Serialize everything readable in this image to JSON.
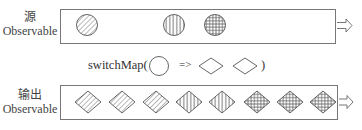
{
  "source": {
    "label_zh": "源",
    "label_en": "Observable",
    "items": [
      {
        "shape": "circle",
        "pattern": "diagonal",
        "cx": 87,
        "cy": 25
      },
      {
        "shape": "circle",
        "pattern": "vertical",
        "cx": 174,
        "cy": 25
      },
      {
        "shape": "circle",
        "pattern": "grid",
        "cx": 215,
        "cy": 25
      }
    ]
  },
  "operator": {
    "name": "switchMap(",
    "arrow": "=>",
    "close": ")",
    "shapes": [
      "circle",
      "diamond",
      "diamond"
    ]
  },
  "output": {
    "label_zh": "输出",
    "label_en": "Observable",
    "items": [
      {
        "shape": "diamond",
        "pattern": "diagonal",
        "cx": 88,
        "cy": 102
      },
      {
        "shape": "diamond",
        "pattern": "diagonal",
        "cx": 122,
        "cy": 102
      },
      {
        "shape": "diamond",
        "pattern": "diagonal",
        "cx": 156,
        "cy": 102
      },
      {
        "shape": "diamond",
        "pattern": "vertical",
        "cx": 189,
        "cy": 102
      },
      {
        "shape": "diamond",
        "pattern": "vertical",
        "cx": 222,
        "cy": 102
      },
      {
        "shape": "diamond",
        "pattern": "grid",
        "cx": 257,
        "cy": 102
      },
      {
        "shape": "diamond",
        "pattern": "grid",
        "cx": 290,
        "cy": 102
      },
      {
        "shape": "diamond",
        "pattern": "grid",
        "cx": 323,
        "cy": 102
      }
    ]
  },
  "colors": {
    "stroke": "#555555",
    "box": "#777777"
  }
}
